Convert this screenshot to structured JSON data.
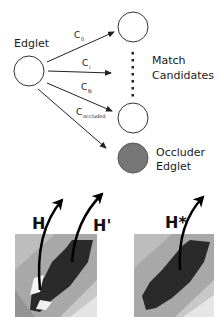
{
  "diagram": {
    "source_node": {
      "label": "Edglet"
    },
    "edges": [
      {
        "label": "C",
        "subscript": "0"
      },
      {
        "label": "C",
        "subscript": "i"
      },
      {
        "label": "C",
        "subscript": "N"
      },
      {
        "label": "C",
        "subscript": "occluded"
      }
    ],
    "candidates_label_line1": "Match",
    "candidates_label_line2": "Candidates",
    "occluder_label_line1": "Occluder",
    "occluder_label_line2": "Edglet",
    "colors": {
      "stroke": "#222222",
      "occluder_fill": "#777777",
      "background": "#ffffff"
    }
  },
  "panels": [
    {
      "name": "left",
      "labels": [
        "H",
        "H'"
      ]
    },
    {
      "name": "right",
      "labels": [
        "H*"
      ]
    }
  ]
}
